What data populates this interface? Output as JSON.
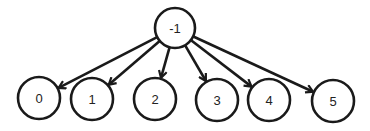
{
  "diagram": {
    "type": "tree",
    "root": {
      "id": "-1",
      "label": "-1"
    },
    "children": [
      {
        "id": "0",
        "label": "0"
      },
      {
        "id": "1",
        "label": "1"
      },
      {
        "id": "2",
        "label": "2"
      },
      {
        "id": "3",
        "label": "3"
      },
      {
        "id": "4",
        "label": "4"
      },
      {
        "id": "5",
        "label": "5"
      }
    ],
    "edges": [
      {
        "from": "-1",
        "to": "0"
      },
      {
        "from": "-1",
        "to": "1"
      },
      {
        "from": "-1",
        "to": "2"
      },
      {
        "from": "-1",
        "to": "3"
      },
      {
        "from": "-1",
        "to": "4"
      },
      {
        "from": "-1",
        "to": "5"
      }
    ],
    "edge_direction": "parent-to-child",
    "stroke_color": "#1a1a1a"
  }
}
